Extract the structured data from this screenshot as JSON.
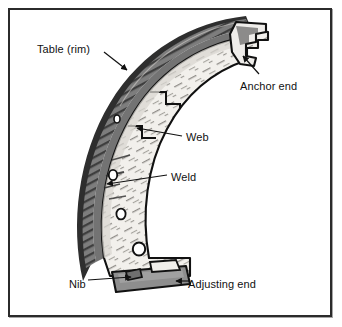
{
  "figure": {
    "background": "#ffffff",
    "frame_color": "#2b2b2b"
  },
  "palette": {
    "outline": "#111111",
    "rim_band": "#7d7d7d",
    "rim_dark": "#4a4a4a",
    "web_face": "#f2f0ec",
    "web_shadow": "#cfcdc8",
    "adjusting_tab": "#8e8e8e",
    "hole_fill": "#ffffff",
    "text": "#111111"
  },
  "labels": [
    {
      "id": "table-rim",
      "text": "Table (rim)",
      "x": 37,
      "y": 44
    },
    {
      "id": "anchor-end",
      "text": "Anchor end",
      "x": 240,
      "y": 81
    },
    {
      "id": "web",
      "text": "Web",
      "x": 186,
      "y": 132
    },
    {
      "id": "weld",
      "text": "Weld",
      "x": 171,
      "y": 172
    },
    {
      "id": "nib",
      "text": "Nib",
      "x": 69,
      "y": 279
    },
    {
      "id": "adjusting-end",
      "text": "Adjusting end",
      "x": 188,
      "y": 279
    }
  ],
  "leader_lines": [
    {
      "id": "table-rim-leader",
      "from": [
        104,
        52
      ],
      "to": [
        127,
        70
      ]
    },
    {
      "id": "anchor-end-leader",
      "from": [
        259,
        74
      ],
      "to": [
        243,
        56
      ]
    },
    {
      "id": "web-leader",
      "from": [
        182,
        136
      ],
      "to": [
        137,
        128
      ]
    },
    {
      "id": "weld-leader",
      "from": [
        167,
        175
      ],
      "to": [
        107,
        184
      ]
    },
    {
      "id": "nib-leader",
      "from": [
        88,
        280
      ],
      "to": [
        131,
        277
      ]
    },
    {
      "id": "adjusting-end-leader",
      "from": [
        186,
        281
      ],
      "to": [
        176,
        281
      ]
    }
  ],
  "parts": [
    {
      "id": "table-rim",
      "name": "Table (rim)",
      "description": "Dark curved outer friction band of the shoe"
    },
    {
      "id": "web",
      "name": "Web",
      "description": "Light inner plate welded to the table, carrying mounting holes"
    },
    {
      "id": "weld",
      "name": "Weld",
      "description": "Weld seam joining web to table"
    },
    {
      "id": "anchor-end",
      "name": "Anchor end",
      "description": "Notched upper end that seats against the anchor pin"
    },
    {
      "id": "adjusting-end",
      "name": "Adjusting end",
      "description": "Flat lower tab engaging the star adjuster"
    },
    {
      "id": "nib",
      "name": "Nib",
      "description": "Small raised tab on the lower rim edge"
    }
  ],
  "web_holes": [
    {
      "cx": 117,
      "cy": 119,
      "r": 3.0
    },
    {
      "cx": 113,
      "cy": 175,
      "r": 4.2
    },
    {
      "cx": 121,
      "cy": 214,
      "r": 4.6
    },
    {
      "cx": 139,
      "cy": 249,
      "r": 6.2
    },
    {
      "cx": 163,
      "cy": 268,
      "r": 4.6
    }
  ]
}
